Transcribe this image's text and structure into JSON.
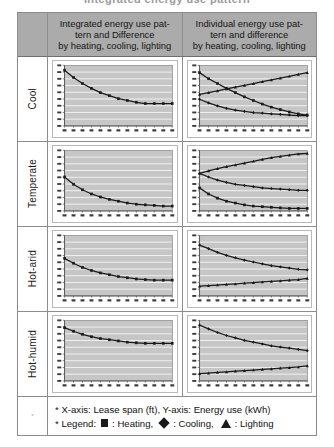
{
  "top_partial_text": "Integrated energy use pattern",
  "header": {
    "corner": "",
    "columns": [
      {
        "lines": [
          "Integrated energy use pat-",
          "tern and Difference",
          "by heating, cooling, lighting"
        ]
      },
      {
        "lines": [
          "Individual energy use pat-",
          "tern and difference",
          "by heating, cooling, lighting"
        ]
      }
    ]
  },
  "rows": [
    {
      "label": "Cool"
    },
    {
      "label": "Temperate"
    },
    {
      "label": "Hot-arid"
    },
    {
      "label": "Hot-humid"
    }
  ],
  "footer": {
    "corner_mark": "*",
    "line1": "* X-axis: Lease span (ft), Y-axis: Energy use (kWh)",
    "legend_prefix": "* Legend:",
    "legend_heating": ": Heating,",
    "legend_cooling": ": Cooling,",
    "legend_lighting": ": Lighting"
  },
  "colors": {
    "header_bg": "#ababab",
    "plot_bg": "#c6c6c6",
    "gridline": "#ffffff",
    "series": "#1a1a1a",
    "border": "#8d8d8d"
  },
  "chart_data": [
    {
      "id": "cool-integrated",
      "type": "line",
      "title": "",
      "xlabel": "Lease span (ft)",
      "ylabel": "Energy use (kWh)",
      "grid": true,
      "legend": "none",
      "x": [
        20,
        25,
        30,
        35,
        40,
        45,
        50,
        55,
        60,
        65,
        70,
        75,
        80
      ],
      "xlim": [
        20,
        80
      ],
      "ylim": [
        0,
        100
      ],
      "series": [
        {
          "name": "Heating",
          "marker": "square",
          "values": [
            92,
            80,
            70,
            62,
            55,
            50,
            45,
            42,
            39,
            37,
            37,
            37,
            37
          ]
        }
      ]
    },
    {
      "id": "cool-individual",
      "type": "line",
      "title": "",
      "xlabel": "Lease span (ft)",
      "ylabel": "Energy use (kWh)",
      "grid": true,
      "legend": "none",
      "x": [
        20,
        25,
        30,
        35,
        40,
        45,
        50,
        55,
        60,
        65,
        70,
        75,
        80
      ],
      "xlim": [
        20,
        80
      ],
      "ylim": [
        0,
        100
      ],
      "series": [
        {
          "name": "Heating",
          "marker": "square",
          "values": [
            88,
            78,
            70,
            62,
            55,
            48,
            42,
            36,
            31,
            27,
            23,
            20,
            18
          ]
        },
        {
          "name": "Lighting",
          "marker": "triangle",
          "values": [
            52,
            55,
            58,
            61,
            64,
            67,
            70,
            73,
            76,
            79,
            82,
            85,
            88
          ]
        },
        {
          "name": "Cooling",
          "marker": "diamond",
          "values": [
            44,
            38,
            33,
            29,
            26,
            24,
            22,
            21,
            20,
            19,
            18,
            17,
            17
          ]
        }
      ]
    },
    {
      "id": "temperate-integrated",
      "type": "line",
      "title": "",
      "xlabel": "Lease span (ft)",
      "ylabel": "Energy use (kWh)",
      "grid": true,
      "legend": "none",
      "x": [
        20,
        25,
        30,
        35,
        40,
        45,
        50,
        55,
        60,
        65,
        70,
        75,
        80
      ],
      "xlim": [
        20,
        80
      ],
      "ylim": [
        0,
        100
      ],
      "series": [
        {
          "name": "Heating",
          "marker": "square",
          "values": [
            56,
            44,
            35,
            28,
            23,
            19,
            16,
            13,
            11,
            10,
            9,
            8,
            8
          ]
        }
      ]
    },
    {
      "id": "temperate-individual",
      "type": "line",
      "title": "",
      "xlabel": "Lease span (ft)",
      "ylabel": "Energy use (kWh)",
      "grid": true,
      "legend": "none",
      "x": [
        20,
        25,
        30,
        35,
        40,
        45,
        50,
        55,
        60,
        65,
        70,
        75,
        80
      ],
      "xlim": [
        20,
        80
      ],
      "ylim": [
        0,
        100
      ],
      "series": [
        {
          "name": "Lighting",
          "marker": "triangle",
          "values": [
            62,
            66,
            70,
            73,
            76,
            79,
            82,
            85,
            88,
            90,
            92,
            94,
            95
          ]
        },
        {
          "name": "Cooling",
          "marker": "diamond",
          "values": [
            62,
            56,
            51,
            47,
            44,
            42,
            40,
            38,
            37,
            36,
            35,
            34,
            34
          ]
        },
        {
          "name": "Heating",
          "marker": "square",
          "values": [
            38,
            28,
            21,
            16,
            13,
            10,
            8,
            7,
            6,
            5,
            4,
            4,
            4
          ]
        }
      ]
    },
    {
      "id": "hotarid-integrated",
      "type": "line",
      "title": "",
      "xlabel": "Lease span (ft)",
      "ylabel": "Energy use (kWh)",
      "grid": true,
      "legend": "none",
      "x": [
        20,
        25,
        30,
        35,
        40,
        45,
        50,
        55,
        60,
        65,
        70,
        75,
        80
      ],
      "xlim": [
        20,
        80
      ],
      "ylim": [
        0,
        100
      ],
      "series": [
        {
          "name": "Heating",
          "marker": "square",
          "values": [
            62,
            54,
            47,
            42,
            38,
            35,
            32,
            30,
            28,
            27,
            26,
            26,
            26
          ]
        }
      ]
    },
    {
      "id": "hotarid-individual",
      "type": "line",
      "title": "",
      "xlabel": "Lease span (ft)",
      "ylabel": "Energy use (kWh)",
      "grid": true,
      "legend": "none",
      "x": [
        20,
        25,
        30,
        35,
        40,
        45,
        50,
        55,
        60,
        65,
        70,
        75,
        80
      ],
      "xlim": [
        20,
        80
      ],
      "ylim": [
        0,
        100
      ],
      "series": [
        {
          "name": "Cooling",
          "marker": "diamond",
          "values": [
            84,
            78,
            72,
            67,
            63,
            59,
            56,
            53,
            50,
            48,
            46,
            44,
            43
          ]
        },
        {
          "name": "Lighting",
          "marker": "triangle",
          "values": [
            16,
            17,
            18,
            19,
            20,
            21,
            22,
            23,
            24,
            25,
            26,
            27,
            29
          ]
        }
      ]
    },
    {
      "id": "hothumid-integrated",
      "type": "line",
      "title": "",
      "xlabel": "Lease span (ft)",
      "ylabel": "Energy use (kWh)",
      "grid": true,
      "legend": "none",
      "x": [
        20,
        25,
        30,
        35,
        40,
        45,
        50,
        55,
        60,
        65,
        70,
        75,
        80
      ],
      "xlim": [
        20,
        80
      ],
      "ylim": [
        0,
        100
      ],
      "series": [
        {
          "name": "Heating",
          "marker": "square",
          "values": [
            88,
            82,
            77,
            73,
            70,
            68,
            66,
            64,
            63,
            62,
            62,
            62,
            62
          ]
        }
      ]
    },
    {
      "id": "hothumid-individual",
      "type": "line",
      "title": "",
      "xlabel": "Lease span (ft)",
      "ylabel": "Energy use (kWh)",
      "grid": true,
      "legend": "none",
      "x": [
        20,
        25,
        30,
        35,
        40,
        45,
        50,
        55,
        60,
        65,
        70,
        75,
        80
      ],
      "xlim": [
        20,
        80
      ],
      "ylim": [
        0,
        100
      ],
      "series": [
        {
          "name": "Cooling",
          "marker": "diamond",
          "values": [
            92,
            86,
            80,
            75,
            71,
            67,
            64,
            61,
            58,
            56,
            54,
            52,
            50
          ]
        },
        {
          "name": "Lighting",
          "marker": "triangle",
          "values": [
            12,
            13,
            14,
            15,
            16,
            17,
            18,
            19,
            20,
            21,
            22,
            23,
            25
          ]
        }
      ]
    }
  ]
}
